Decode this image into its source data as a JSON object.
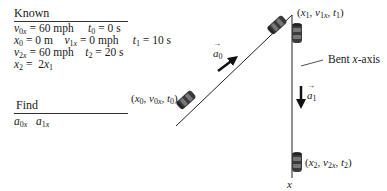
{
  "known": {
    "heading": "Known",
    "rows": [
      [
        {
          "sym": "v",
          "sub": "0x",
          "rest": " = 60 mph"
        },
        {
          "sym": "t",
          "sub": "0",
          "rest": " = 0 s"
        }
      ],
      [
        {
          "sym": "x",
          "sub": "0",
          "rest": " = 0 m"
        },
        {
          "sym": "v",
          "sub": "1x",
          "rest": " = 0 mph"
        },
        {
          "sym": "t",
          "sub": "1",
          "rest": " = 10 s"
        }
      ],
      [
        {
          "sym": "v",
          "sub": "2x",
          "rest": " = 60 mph"
        },
        {
          "sym": "t",
          "sub": "2",
          "rest": " = 20 s"
        }
      ],
      [
        {
          "sym": "x",
          "sub": "2",
          "rest": " = 2"
        },
        {
          "sym": "x",
          "sub": "1",
          "rest": ""
        }
      ]
    ]
  },
  "find": {
    "heading": "Find",
    "items": [
      {
        "sym": "a",
        "sub": "0x"
      },
      {
        "sym": "a",
        "sub": "1x"
      }
    ]
  },
  "diagram": {
    "point0": "(x0, v0x, t0)",
    "point1": "(x1, v1x, t1)",
    "point2": "(x2, v2x, t2)",
    "accel0": "a0",
    "accel1": "a1",
    "axis_note": "Bent x-axis",
    "axis_label": "x"
  }
}
